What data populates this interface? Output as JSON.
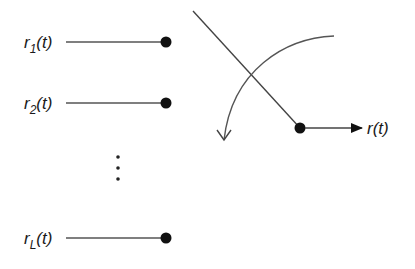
{
  "diagram": {
    "inputs": [
      {
        "base": "r",
        "sub": "1",
        "arg": "(t)"
      },
      {
        "base": "r",
        "sub": "2",
        "arg": "(t)"
      },
      {
        "base": "r",
        "sub": "L",
        "arg": "(t)"
      }
    ],
    "ellipsis": "⋮",
    "output": {
      "base": "r",
      "arg": "(t)"
    },
    "colors": {
      "line": "#555555",
      "dot": "#111111",
      "text": "#1a1a1a"
    }
  }
}
